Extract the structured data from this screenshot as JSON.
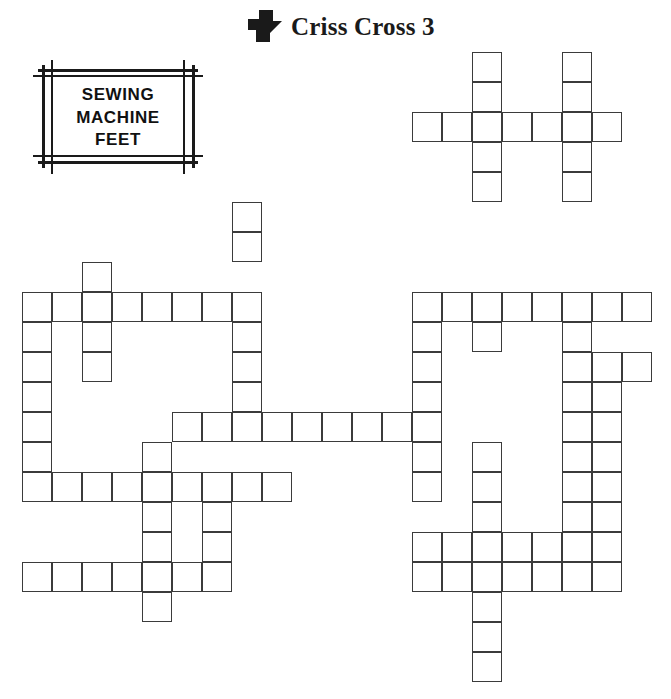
{
  "header": {
    "title": "Criss Cross 3",
    "logo_icon": "zigzag-arrow-icon"
  },
  "caption": {
    "lines": [
      "SEWING",
      "MACHINE",
      "FEET"
    ],
    "frame_style": "double-line-crosshatch"
  },
  "colors": {
    "ink": "#111111",
    "grid_line": "#3b3b3b",
    "cell_fill": "#ffffff",
    "page_background": "#ffffff"
  },
  "grid": {
    "cell_size": 30,
    "origin_x": 22,
    "origin_y": 52,
    "columns": 22,
    "rows": 22,
    "cells": [
      [
        15,
        0
      ],
      [
        18,
        0
      ],
      [
        15,
        1
      ],
      [
        18,
        1
      ],
      [
        13,
        2
      ],
      [
        14,
        2
      ],
      [
        15,
        2
      ],
      [
        16,
        2
      ],
      [
        17,
        2
      ],
      [
        18,
        2
      ],
      [
        19,
        2
      ],
      [
        15,
        3
      ],
      [
        18,
        3
      ],
      [
        15,
        4
      ],
      [
        18,
        4
      ],
      [
        7,
        5
      ],
      [
        7,
        6
      ],
      [
        2,
        7
      ],
      [
        0,
        8
      ],
      [
        1,
        8
      ],
      [
        2,
        8
      ],
      [
        3,
        8
      ],
      [
        4,
        8
      ],
      [
        5,
        8
      ],
      [
        6,
        8
      ],
      [
        7,
        8
      ],
      [
        13,
        8
      ],
      [
        14,
        8
      ],
      [
        15,
        8
      ],
      [
        16,
        8
      ],
      [
        17,
        8
      ],
      [
        18,
        8
      ],
      [
        19,
        8
      ],
      [
        20,
        8
      ],
      [
        0,
        9
      ],
      [
        2,
        9
      ],
      [
        7,
        9
      ],
      [
        13,
        9
      ],
      [
        15,
        9
      ],
      [
        18,
        9
      ],
      [
        0,
        10
      ],
      [
        2,
        10
      ],
      [
        7,
        10
      ],
      [
        13,
        10
      ],
      [
        18,
        10
      ],
      [
        19,
        10
      ],
      [
        20,
        10
      ],
      [
        0,
        11
      ],
      [
        7,
        11
      ],
      [
        13,
        11
      ],
      [
        18,
        11
      ],
      [
        19,
        11
      ],
      [
        0,
        12
      ],
      [
        5,
        12
      ],
      [
        6,
        12
      ],
      [
        7,
        12
      ],
      [
        8,
        12
      ],
      [
        9,
        12
      ],
      [
        10,
        12
      ],
      [
        11,
        12
      ],
      [
        12,
        12
      ],
      [
        13,
        12
      ],
      [
        18,
        12
      ],
      [
        19,
        12
      ],
      [
        0,
        13
      ],
      [
        4,
        13
      ],
      [
        13,
        13
      ],
      [
        15,
        13
      ],
      [
        18,
        13
      ],
      [
        19,
        13
      ],
      [
        0,
        14
      ],
      [
        1,
        14
      ],
      [
        2,
        14
      ],
      [
        3,
        14
      ],
      [
        4,
        14
      ],
      [
        5,
        14
      ],
      [
        6,
        14
      ],
      [
        7,
        14
      ],
      [
        8,
        14
      ],
      [
        13,
        14
      ],
      [
        15,
        14
      ],
      [
        18,
        14
      ],
      [
        19,
        14
      ],
      [
        4,
        15
      ],
      [
        6,
        15
      ],
      [
        15,
        15
      ],
      [
        18,
        15
      ],
      [
        19,
        15
      ],
      [
        4,
        16
      ],
      [
        6,
        16
      ],
      [
        13,
        16
      ],
      [
        14,
        16
      ],
      [
        15,
        16
      ],
      [
        16,
        16
      ],
      [
        17,
        16
      ],
      [
        18,
        16
      ],
      [
        19,
        16
      ],
      [
        0,
        17
      ],
      [
        1,
        17
      ],
      [
        2,
        17
      ],
      [
        3,
        17
      ],
      [
        4,
        17
      ],
      [
        5,
        17
      ],
      [
        6,
        17
      ],
      [
        13,
        17
      ],
      [
        14,
        17
      ],
      [
        15,
        17
      ],
      [
        16,
        17
      ],
      [
        17,
        17
      ],
      [
        18,
        17
      ],
      [
        19,
        17
      ],
      [
        4,
        18
      ],
      [
        15,
        18
      ],
      [
        15,
        19
      ],
      [
        15,
        20
      ]
    ]
  }
}
